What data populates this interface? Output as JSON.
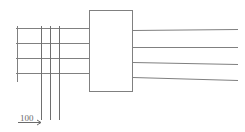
{
  "drawing": {
    "title": "Cable entry schematic",
    "canvas": {
      "width": 245,
      "height": 132,
      "background": "#ffffff"
    },
    "style": {
      "line_color": "#808080",
      "line_color_dark": "#6b6b6b",
      "line_width": 1,
      "box_fill": "#ffffff"
    },
    "equipment_box": {
      "label": "",
      "x": 89,
      "y": 10,
      "width": 44,
      "height": 82,
      "stroke": "#808080",
      "fill": "#ffffff"
    },
    "incoming_lines": {
      "name": "incoming-cable-lines",
      "count": 4,
      "x_start": 16,
      "x_end": 89,
      "y_values": [
        28,
        43,
        58,
        73
      ]
    },
    "outgoing_lines": {
      "name": "outgoing-cable-lines",
      "count": 4,
      "x_start": 133,
      "x_end": 238,
      "y_start_values": [
        30,
        47,
        62,
        77
      ],
      "y_end_values": [
        29,
        47,
        64,
        80
      ]
    },
    "left_riser": {
      "name": "left-vertical-riser",
      "x": 17,
      "y_top": 26,
      "y_bottom": 82
    },
    "vertical_lines": {
      "name": "vertical-crossing-lines",
      "count": 3,
      "x_values": [
        41,
        50,
        59
      ],
      "y_top": 26,
      "y_bottom": 120
    },
    "dimension": {
      "name": "dimension-100",
      "label": "100",
      "value": 100,
      "units": "",
      "text_x": 20,
      "text_y": 121,
      "line_y": 122,
      "extension_left_x": 17,
      "extension_right_x": 41,
      "arrow_x": 41,
      "underline_x_start": 18,
      "underline_x_end": 38,
      "underline_y": 123
    }
  }
}
